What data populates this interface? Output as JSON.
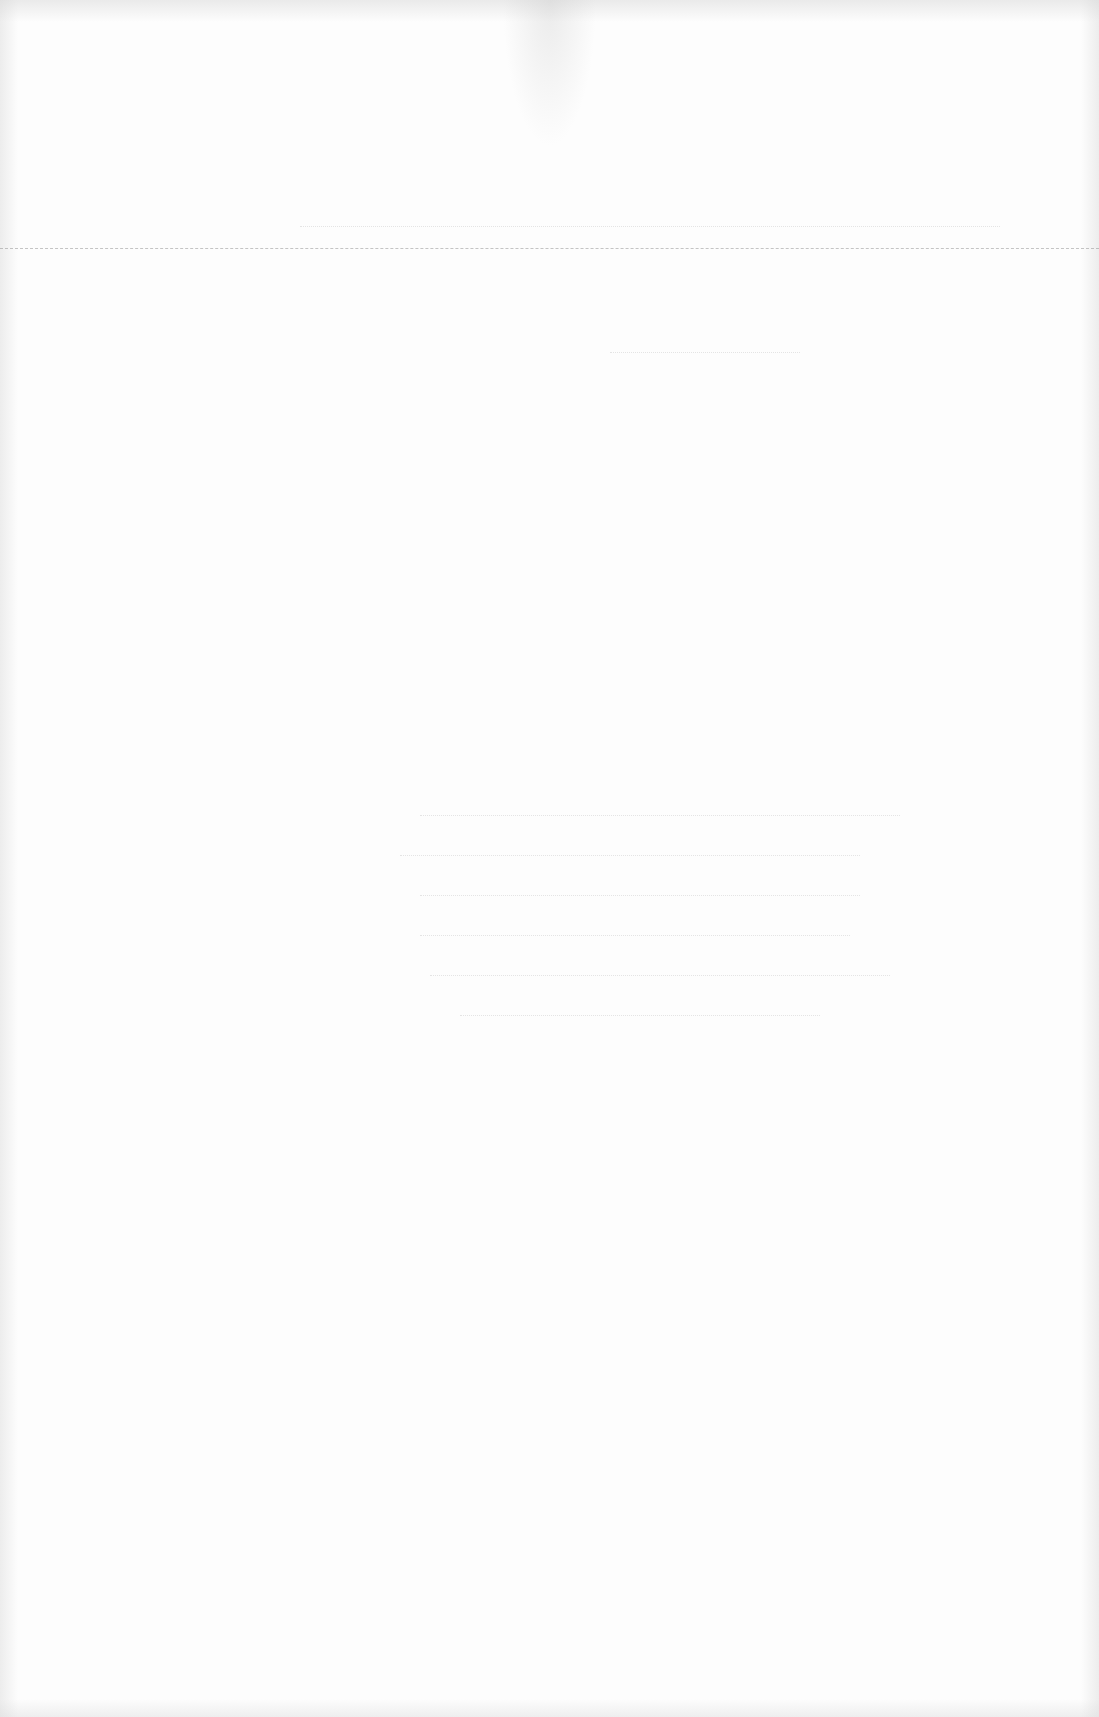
{
  "document": {
    "type": "scanned-blank-page",
    "visible_text": "",
    "rule": {
      "y": 248,
      "color": "#969696",
      "style": "dashed"
    },
    "bleed_through_lines_y": [
      226,
      352,
      380,
      815,
      855,
      895,
      935,
      975,
      1015
    ]
  }
}
